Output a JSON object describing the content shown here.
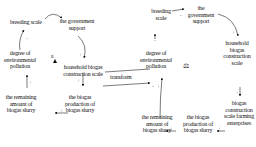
{
  "left_diagram": {
    "nodes": [
      {
        "id": "breeding_scale",
        "text": "breeding scale"
      },
      {
        "id": "government_support",
        "text": "the government support"
      },
      {
        "id": "degree_pollution",
        "lines": [
          "degree of",
          "environmental",
          "pollution"
        ]
      },
      {
        "id": "household_biogas",
        "lines": [
          "household biogas",
          "construction scale"
        ]
      },
      {
        "id": "remaining_slurry",
        "lines": [
          "the remaining",
          "amount of",
          "biogas slurry"
        ]
      },
      {
        "id": "biogas_production",
        "lines": [
          "the biogas",
          "production of",
          "biogas slurry"
        ]
      }
    ],
    "balance_icon_label": "B"
  },
  "transform_label": "transform",
  "right_diagram": {
    "nodes": [
      {
        "id": "breeding_scale",
        "lines": [
          "breeding",
          "scale"
        ]
      },
      {
        "id": "government_support",
        "lines": [
          "the",
          "government",
          "support"
        ]
      },
      {
        "id": "degree_pollution",
        "lines": [
          "degree of",
          "environmental",
          "pollution"
        ]
      },
      {
        "id": "household_biogas",
        "lines": [
          "household",
          "biogas",
          "construction",
          "scale"
        ]
      },
      {
        "id": "biogas_construction_farming",
        "lines": [
          "biogas",
          "construction",
          "scale farming",
          "enterprises"
        ]
      },
      {
        "id": "biogas_production",
        "lines": [
          "the biogas",
          "production of",
          "biogas slurry"
        ]
      },
      {
        "id": "remaining_slurry",
        "lines": [
          "the remaining",
          "amount of",
          "biogas slurry"
        ]
      }
    ]
  },
  "signs": {
    "plus": "+",
    "minus": "-"
  }
}
